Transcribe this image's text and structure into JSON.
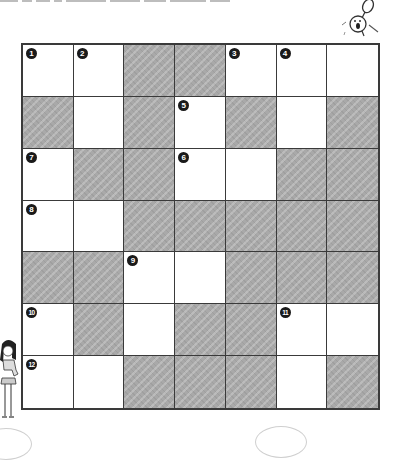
{
  "puzzle": {
    "type": "crossword",
    "rows": 7,
    "cols": 7,
    "colors": {
      "grid_line": "#3a3a3a",
      "shaded_cell": "#a9a9a9",
      "white_cell": "#ffffff",
      "number_badge": "#1a1a1a"
    },
    "grid": [
      [
        {
          "n": "1"
        },
        {
          "n": "2"
        },
        {
          "s": true
        },
        {
          "s": true
        },
        {
          "n": "3"
        },
        {
          "n": "4"
        },
        {}
      ],
      [
        {
          "s": true
        },
        {},
        {
          "s": true
        },
        {
          "n": "5"
        },
        {
          "s": true
        },
        {},
        {
          "s": true
        }
      ],
      [
        {
          "n": "7"
        },
        {
          "s": true
        },
        {
          "s": true
        },
        {
          "n": "6"
        },
        {},
        {
          "s": true
        },
        {
          "s": true
        }
      ],
      [
        {
          "n": "8"
        },
        {},
        {
          "s": true
        },
        {
          "s": true
        },
        {
          "s": true
        },
        {
          "s": true
        },
        {
          "s": true
        }
      ],
      [
        {
          "s": true
        },
        {
          "s": true
        },
        {
          "n": "9"
        },
        {},
        {
          "s": true
        },
        {
          "s": true
        },
        {
          "s": true
        }
      ],
      [
        {
          "n": "10"
        },
        {
          "s": true
        },
        {},
        {
          "s": true
        },
        {
          "s": true
        },
        {
          "n": "11"
        },
        {}
      ],
      [
        {
          "n": "12"
        },
        {},
        {
          "s": true
        },
        {
          "s": true
        },
        {
          "s": true
        },
        {},
        {
          "s": true
        }
      ]
    ]
  },
  "decorations": {
    "top_right": "surprised-character-icon",
    "left": "girl-character-icon"
  }
}
